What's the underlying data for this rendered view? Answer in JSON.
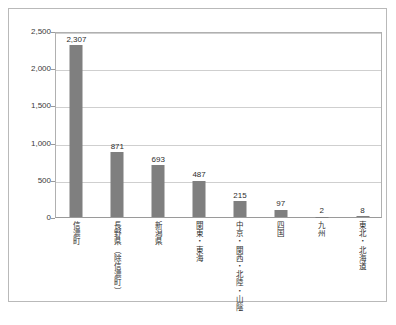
{
  "chart_data": {
    "type": "bar",
    "title": "",
    "subtitle": "",
    "xlabel": "",
    "ylabel": "",
    "ylim": [
      0,
      2500
    ],
    "ytick_labels": [
      "0",
      "500",
      "1,000",
      "1,500",
      "2,000",
      "2,500"
    ],
    "ytick_values": [
      0,
      500,
      1000,
      1500,
      2000,
      2500
    ],
    "grid": true,
    "legend": false,
    "legend_position": "none",
    "bar_color": "#7f7f7f",
    "categories": [
      "信濃町",
      "長野県（除信濃町）",
      "新潟県",
      "関東・東海",
      "中京・関西・北陸・山陰",
      "四国",
      "九州",
      "東北・北海道"
    ],
    "values": [
      2307,
      871,
      693,
      487,
      215,
      97,
      2,
      8
    ],
    "value_labels": [
      "2,307",
      "871",
      "693",
      "487",
      "215",
      "97",
      "2",
      "8"
    ]
  }
}
